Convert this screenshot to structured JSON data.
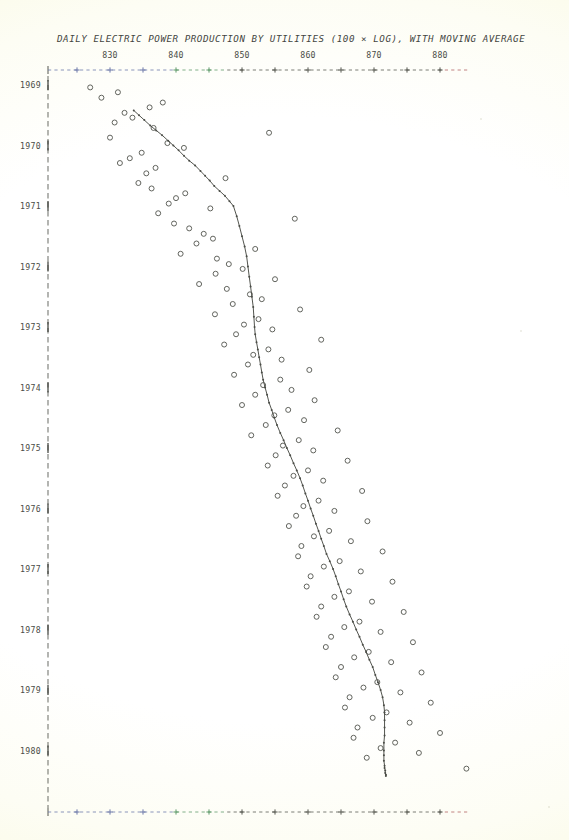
{
  "chart_data": {
    "type": "scatter",
    "title": "DAILY ELECTRIC POWER PRODUCTION BY UTILITIES (100 × LOG), WITH MOVING AVERAGE",
    "xlabel": "",
    "ylabel": "",
    "orientation": "time-on-y-axis",
    "grid": false,
    "legend": null,
    "xlim": [
      824,
      885
    ],
    "ylim": [
      1968.75,
      1980.55
    ],
    "xticks": [
      830,
      840,
      850,
      860,
      870,
      880
    ],
    "xtick_minor_step": 5,
    "xtick_labels": [
      "830",
      "840",
      "850",
      "860",
      "870",
      "880"
    ],
    "yticks": [
      1969,
      1970,
      1971,
      1972,
      1973,
      1974,
      1975,
      1976,
      1977,
      1978,
      1979,
      1980
    ],
    "ytick_labels": [
      "1969",
      "1970",
      "1971",
      "1972",
      "1973",
      "1974",
      "1975",
      "1976",
      "1977",
      "1978",
      "1979",
      "1980"
    ],
    "series": [
      {
        "name": "monthly observations",
        "marker": "open-circle",
        "type": "scatter",
        "x": [
          827.0,
          831.2,
          828.7,
          838.0,
          836.0,
          832.2,
          833.4,
          830.7,
          836.6,
          854.1,
          830.0,
          838.7,
          841.2,
          834.8,
          833.0,
          831.5,
          836.9,
          835.5,
          847.5,
          834.3,
          836.3,
          841.4,
          840.0,
          838.9,
          845.2,
          837.3,
          858.0,
          839.7,
          842.0,
          844.2,
          845.6,
          843.1,
          852.0,
          840.7,
          846.2,
          848.0,
          850.1,
          846.0,
          855.0,
          843.5,
          847.7,
          851.2,
          853.0,
          848.6,
          858.8,
          845.9,
          852.5,
          850.3,
          854.6,
          849.1,
          862.0,
          847.3,
          854.0,
          851.7,
          856.0,
          850.9,
          860.2,
          848.8,
          855.8,
          853.2,
          857.5,
          852.0,
          861.0,
          850.0,
          857.0,
          854.9,
          859.4,
          853.6,
          864.5,
          851.4,
          858.6,
          856.2,
          860.8,
          855.1,
          866.0,
          853.9,
          860.0,
          857.8,
          862.3,
          856.5,
          868.2,
          855.4,
          861.6,
          859.3,
          864.0,
          858.2,
          869.0,
          857.1,
          863.2,
          860.9,
          866.5,
          859.0,
          871.3,
          858.5,
          864.8,
          862.4,
          868.0,
          860.4,
          872.8,
          859.8,
          866.2,
          864.0,
          869.7,
          862.0,
          874.5,
          861.3,
          867.8,
          865.5,
          871.0,
          863.5,
          875.9,
          862.7,
          869.2,
          867.0,
          872.6,
          865.0,
          877.2,
          864.2,
          870.5,
          868.4,
          874.0,
          866.3,
          878.6,
          865.6,
          871.9,
          869.8,
          875.4,
          867.5,
          880.0,
          866.9,
          873.2,
          871.0,
          876.8,
          868.9,
          884.0
        ],
        "y": [
          1969.04,
          1969.12,
          1969.21,
          1969.29,
          1969.37,
          1969.46,
          1969.54,
          1969.62,
          1969.71,
          1969.79,
          1969.87,
          1969.96,
          1970.04,
          1970.12,
          1970.21,
          1970.29,
          1970.37,
          1970.46,
          1970.54,
          1970.62,
          1970.71,
          1970.79,
          1970.87,
          1970.96,
          1971.04,
          1971.12,
          1971.21,
          1971.29,
          1971.37,
          1971.46,
          1971.54,
          1971.62,
          1971.71,
          1971.79,
          1971.87,
          1971.96,
          1972.04,
          1972.12,
          1972.21,
          1972.29,
          1972.37,
          1972.46,
          1972.54,
          1972.62,
          1972.71,
          1972.79,
          1972.87,
          1972.96,
          1973.04,
          1973.12,
          1973.21,
          1973.29,
          1973.37,
          1973.46,
          1973.54,
          1973.62,
          1973.71,
          1973.79,
          1973.87,
          1973.96,
          1974.04,
          1974.12,
          1974.21,
          1974.29,
          1974.37,
          1974.46,
          1974.54,
          1974.62,
          1974.71,
          1974.79,
          1974.87,
          1974.96,
          1975.04,
          1975.12,
          1975.21,
          1975.29,
          1975.37,
          1975.46,
          1975.54,
          1975.62,
          1975.71,
          1975.79,
          1975.87,
          1975.96,
          1976.04,
          1976.12,
          1976.21,
          1976.29,
          1976.37,
          1976.46,
          1976.54,
          1976.62,
          1976.71,
          1976.79,
          1976.87,
          1976.96,
          1977.04,
          1977.12,
          1977.21,
          1977.29,
          1977.37,
          1977.46,
          1977.54,
          1977.62,
          1977.71,
          1977.79,
          1977.87,
          1977.96,
          1978.04,
          1978.12,
          1978.21,
          1978.29,
          1978.37,
          1978.46,
          1978.54,
          1978.62,
          1978.71,
          1978.79,
          1978.87,
          1978.96,
          1979.04,
          1979.12,
          1979.21,
          1979.29,
          1979.37,
          1979.46,
          1979.54,
          1979.62,
          1979.71,
          1979.79,
          1979.87,
          1979.96,
          1980.04,
          1980.12,
          1980.3
        ]
      },
      {
        "name": "moving average",
        "marker": "dot",
        "type": "line",
        "x": [
          833.6,
          834.4,
          835.2,
          836.1,
          837.0,
          837.9,
          838.8,
          839.6,
          840.4,
          841.2,
          842.0,
          842.9,
          843.7,
          844.4,
          845.1,
          845.8,
          846.6,
          847.4,
          848.1,
          848.7,
          849.2,
          849.6,
          850.0,
          850.4,
          850.7,
          850.9,
          851.1,
          851.3,
          851.5,
          851.7,
          851.8,
          851.9,
          852.0,
          852.2,
          852.4,
          852.6,
          852.8,
          853.0,
          853.2,
          853.5,
          853.8,
          854.1,
          854.5,
          854.9,
          855.3,
          855.8,
          856.3,
          856.8,
          857.3,
          857.8,
          858.3,
          858.8,
          859.2,
          859.6,
          860.0,
          860.4,
          860.8,
          861.2,
          861.6,
          862.0,
          862.4,
          862.8,
          863.3,
          863.8,
          864.2,
          864.6,
          865.0,
          865.4,
          865.8,
          866.3,
          866.8,
          867.3,
          867.8,
          868.3,
          868.8,
          869.3,
          869.8,
          870.2,
          870.6,
          871.0,
          871.3,
          871.5,
          871.6,
          871.6,
          871.6,
          871.6,
          871.5,
          871.5,
          871.5,
          871.5,
          871.6,
          871.6,
          871.7,
          871.7,
          871.8,
          871.8
        ],
        "y": [
          1969.42,
          1969.5,
          1969.58,
          1969.67,
          1969.75,
          1969.83,
          1969.92,
          1970.0,
          1970.08,
          1970.17,
          1970.25,
          1970.33,
          1970.42,
          1970.5,
          1970.58,
          1970.67,
          1970.75,
          1970.83,
          1970.92,
          1971.0,
          1971.17,
          1971.33,
          1971.5,
          1971.67,
          1971.83,
          1972.0,
          1972.17,
          1972.33,
          1972.5,
          1972.67,
          1972.83,
          1973.0,
          1973.12,
          1973.25,
          1973.37,
          1973.5,
          1973.62,
          1973.75,
          1973.87,
          1974.0,
          1974.12,
          1974.25,
          1974.37,
          1974.5,
          1974.62,
          1974.75,
          1974.87,
          1975.0,
          1975.12,
          1975.25,
          1975.37,
          1975.5,
          1975.62,
          1975.75,
          1975.87,
          1976.0,
          1976.12,
          1976.25,
          1976.37,
          1976.5,
          1976.62,
          1976.75,
          1976.87,
          1977.0,
          1977.12,
          1977.25,
          1977.37,
          1977.5,
          1977.62,
          1977.75,
          1977.87,
          1978.0,
          1978.12,
          1978.25,
          1978.37,
          1978.5,
          1978.62,
          1978.75,
          1978.87,
          1979.0,
          1979.12,
          1979.25,
          1979.37,
          1979.5,
          1979.62,
          1979.75,
          1979.87,
          1980.0,
          1980.08,
          1980.17,
          1980.25,
          1980.29,
          1980.33,
          1980.37,
          1980.4,
          1980.42
        ]
      }
    ]
  },
  "colors": {
    "ink": "#3a3c36",
    "marker": "#5a5c55",
    "line": "#4a4c46",
    "axis": "#55574f",
    "axis_tint_blue": "#6a76a8",
    "axis_tint_green": "#5f9a6a",
    "axis_tint_red": "#b06060"
  }
}
